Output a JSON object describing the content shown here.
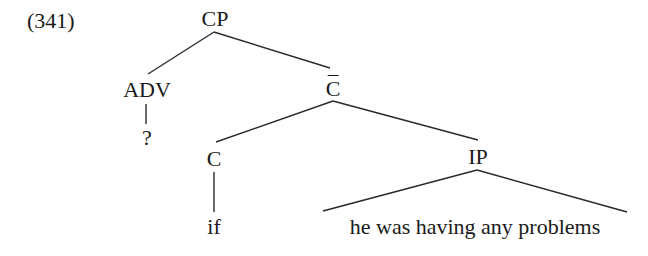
{
  "example": {
    "number": "(341)"
  },
  "tree": {
    "root": {
      "label": "CP"
    },
    "adv": {
      "label": "ADV",
      "child": "?"
    },
    "cbar": {
      "label": "C"
    },
    "c": {
      "label": "C",
      "child": "if"
    },
    "ip": {
      "label": "IP",
      "terminal": "he was having any problems"
    }
  }
}
